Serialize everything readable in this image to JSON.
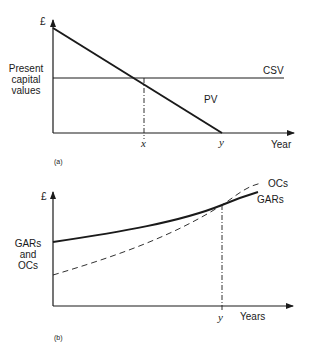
{
  "panel_a": {
    "id_label": "(a)",
    "y_axis_symbol": "£",
    "y_axis_title": "Present capital values",
    "y_axis_title_lines": [
      "Present",
      "capital",
      "values"
    ],
    "x_axis_title": "Year",
    "curves": {
      "csv_label": "CSV",
      "pv_label": "PV"
    },
    "markers": {
      "x_label": "x",
      "y_label": "y"
    }
  },
  "panel_b": {
    "id_label": "(b)",
    "y_axis_symbol": "£",
    "y_axis_title_lines": [
      "GARs",
      "and",
      "OCs"
    ],
    "x_axis_title": "Years",
    "curves": {
      "gars_label": "GARs",
      "ocs_label": "OCs"
    },
    "markers": {
      "y_label": "y"
    }
  },
  "colors": {
    "line": "#1a1a1a",
    "background": "#ffffff"
  }
}
